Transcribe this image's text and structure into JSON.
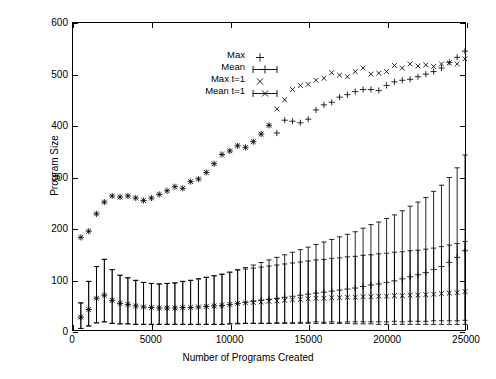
{
  "chart_data": {
    "type": "scatter",
    "title": "",
    "xlabel": "Number of Programs Created",
    "ylabel": "Program Size",
    "xlim": [
      0,
      25000
    ],
    "ylim": [
      0,
      600
    ],
    "xticks": [
      0,
      5000,
      10000,
      15000,
      20000,
      25000
    ],
    "yticks": [
      0,
      100,
      200,
      300,
      400,
      500,
      600
    ],
    "xtick_labels": [
      "0",
      "5000",
      "10000",
      "15000",
      "20000",
      "25000"
    ],
    "ytick_labels": [
      "0",
      "100",
      "200",
      "300",
      "400",
      "500",
      "600"
    ],
    "grid": false,
    "legend_position": "top-left-inside",
    "legend": [
      {
        "label": "Max",
        "marker": "plus",
        "errorbars": false
      },
      {
        "label": "Mean",
        "marker": "plus",
        "errorbars": true
      },
      {
        "label": "Max t=1",
        "marker": "cross",
        "errorbars": false
      },
      {
        "label": "Mean t=1",
        "marker": "cross",
        "errorbars": true
      }
    ],
    "x": [
      500,
      1000,
      1500,
      2000,
      2500,
      3000,
      3500,
      4000,
      4500,
      5000,
      5500,
      6000,
      6500,
      7000,
      7500,
      8000,
      8500,
      9000,
      9500,
      10000,
      10500,
      11000,
      11500,
      12000,
      12500,
      13000,
      13500,
      14000,
      14500,
      15000,
      15500,
      16000,
      16500,
      17000,
      17500,
      18000,
      18500,
      19000,
      19500,
      20000,
      20500,
      21000,
      21500,
      22000,
      22500,
      23000,
      23500,
      24000,
      24500,
      25000
    ],
    "series": [
      {
        "name": "Max",
        "marker": "plus",
        "errorbars": false,
        "values": [
          181,
          193,
          227,
          250,
          262,
          260,
          262,
          258,
          253,
          258,
          265,
          272,
          280,
          277,
          290,
          295,
          308,
          325,
          343,
          350,
          360,
          357,
          368,
          383,
          400,
          385,
          410,
          408,
          405,
          412,
          430,
          440,
          445,
          455,
          460,
          466,
          470,
          470,
          468,
          478,
          485,
          488,
          490,
          495,
          500,
          505,
          512,
          523,
          533,
          545
        ]
      },
      {
        "name": "Max t=1",
        "marker": "cross",
        "errorbars": false,
        "values": [
          181,
          193,
          227,
          250,
          262,
          260,
          262,
          258,
          253,
          258,
          265,
          272,
          280,
          277,
          290,
          295,
          308,
          325,
          343,
          350,
          360,
          357,
          368,
          383,
          400,
          432,
          450,
          470,
          478,
          480,
          488,
          492,
          503,
          498,
          495,
          505,
          512,
          500,
          502,
          505,
          517,
          512,
          520,
          516,
          518,
          515,
          520,
          522,
          520,
          530
        ]
      },
      {
        "name": "Mean",
        "marker": "plus",
        "errorbars": true,
        "values": [
          25,
          40,
          62,
          68,
          58,
          52,
          50,
          47,
          45,
          44,
          43,
          43,
          43,
          44,
          44,
          45,
          46,
          47,
          48,
          50,
          52,
          54,
          56,
          58,
          60,
          62,
          64,
          66,
          68,
          70,
          72,
          74,
          76,
          78,
          80,
          82,
          85,
          88,
          90,
          93,
          96,
          100,
          104,
          108,
          112,
          118,
          124,
          132,
          142,
          155
        ]
      },
      {
        "name": "Mean error",
        "marker": "plus",
        "errorbars": true,
        "err_low": [
          22,
          32,
          48,
          52,
          45,
          40,
          38,
          36,
          34,
          33,
          32,
          32,
          32,
          33,
          33,
          34,
          35,
          36,
          37,
          38,
          40,
          41,
          43,
          45,
          47,
          49,
          51,
          53,
          55,
          57,
          59,
          61,
          63,
          65,
          67,
          70,
          73,
          76,
          79,
          82,
          85,
          89,
          93,
          97,
          101,
          107,
          113,
          121,
          131,
          144
        ],
        "err_high": [
          28,
          55,
          62,
          70,
          60,
          55,
          52,
          50,
          48,
          47,
          47,
          48,
          49,
          51,
          53,
          55,
          57,
          59,
          61,
          63,
          66,
          68,
          71,
          74,
          77,
          80,
          83,
          86,
          89,
          92,
          95,
          98,
          101,
          104,
          107,
          110,
          114,
          118,
          121,
          125,
          129,
          133,
          138,
          142,
          147,
          153,
          159,
          166,
          175,
          187
        ]
      },
      {
        "name": "Mean t=1",
        "marker": "cross",
        "errorbars": true,
        "values": [
          25,
          40,
          62,
          68,
          58,
          52,
          50,
          47,
          45,
          44,
          43,
          43,
          43,
          44,
          44,
          45,
          46,
          47,
          48,
          50,
          52,
          53,
          54,
          55,
          56,
          57,
          58,
          59,
          60,
          61,
          62,
          62,
          63,
          63,
          64,
          64,
          65,
          65,
          66,
          66,
          67,
          67,
          68,
          68,
          69,
          70,
          71,
          72,
          73,
          75
        ],
        "err_low": [
          22,
          32,
          48,
          52,
          45,
          40,
          38,
          36,
          34,
          33,
          32,
          32,
          32,
          33,
          33,
          34,
          35,
          36,
          37,
          38,
          39,
          40,
          41,
          42,
          43,
          43,
          44,
          45,
          45,
          46,
          46,
          47,
          47,
          48,
          48,
          48,
          49,
          49,
          50,
          50,
          50,
          51,
          51,
          51,
          52,
          52,
          53,
          54,
          55,
          56
        ],
        "err_high": [
          28,
          55,
          62,
          70,
          60,
          55,
          52,
          50,
          48,
          47,
          47,
          48,
          49,
          51,
          53,
          55,
          57,
          59,
          61,
          63,
          65,
          66,
          67,
          68,
          69,
          70,
          71,
          72,
          73,
          74,
          75,
          76,
          77,
          78,
          79,
          80,
          81,
          82,
          83,
          84,
          85,
          86,
          87,
          88,
          89,
          90,
          92,
          94,
          96,
          98
        ]
      }
    ],
    "colors": {
      "ink": "#000000",
      "background": "#ffffff"
    }
  }
}
